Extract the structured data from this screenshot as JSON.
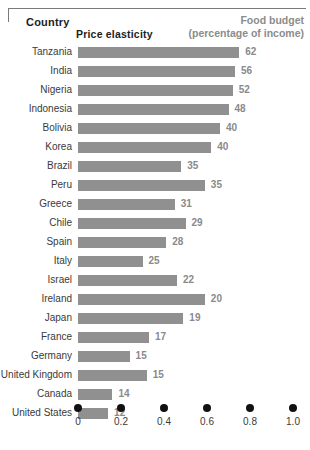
{
  "header": {
    "country_label": "Country",
    "budget_label_line1": "Food budget",
    "budget_label_line2": "(percentage of income)"
  },
  "axis": {
    "title": "Price elasticity",
    "ticks": [
      "0",
      "0.2",
      "0.4",
      "0.6",
      "0.8",
      "1.0"
    ]
  },
  "colors": {
    "bar": "#909090",
    "value_text": "#8a8a8a",
    "label_text": "#3a3a3a",
    "header_accent": "#8c8c8c",
    "tick_dot": "#111111"
  },
  "chart_data": {
    "type": "bar",
    "orientation": "horizontal",
    "title": "",
    "xlabel": "Price elasticity",
    "ylabel": "Country",
    "xlim": [
      0,
      1.0
    ],
    "xticks": [
      0,
      0.2,
      0.4,
      0.6,
      0.8,
      1.0
    ],
    "grid": false,
    "legend": false,
    "value_label_note": "Food budget (percentage of income)",
    "categories": [
      "Tanzania",
      "India",
      "Nigeria",
      "Indonesia",
      "Bolivia",
      "Korea",
      "Brazil",
      "Peru",
      "Greece",
      "Chile",
      "Spain",
      "Italy",
      "Israel",
      "Ireland",
      "Japan",
      "France",
      "Germany",
      "United Kingdom",
      "Canada",
      "United States"
    ],
    "values": [
      0.75,
      0.73,
      0.72,
      0.7,
      0.66,
      0.62,
      0.48,
      0.59,
      0.45,
      0.5,
      0.41,
      0.3,
      0.46,
      0.59,
      0.49,
      0.33,
      0.24,
      0.32,
      0.16,
      0.14
    ],
    "data_labels": [
      62,
      56,
      52,
      48,
      40,
      40,
      35,
      35,
      31,
      29,
      28,
      25,
      22,
      20,
      19,
      17,
      15,
      15,
      14,
      12
    ]
  }
}
